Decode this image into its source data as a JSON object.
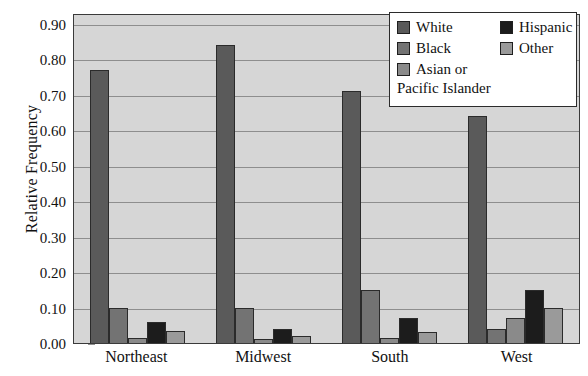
{
  "chart_data": {
    "type": "bar",
    "title": "",
    "xlabel": "",
    "ylabel": "Relative Frequency",
    "ylim": [
      0.0,
      0.93
    ],
    "grid": true,
    "legend_position": "top-right",
    "categories": [
      "Northeast",
      "Midwest",
      "South",
      "West"
    ],
    "y_ticks": [
      "0.00",
      "0.10",
      "0.20",
      "0.30",
      "0.40",
      "0.50",
      "0.60",
      "0.70",
      "0.80",
      "0.90"
    ],
    "y_tick_values": [
      0.0,
      0.1,
      0.2,
      0.3,
      0.4,
      0.5,
      0.6,
      0.7,
      0.8,
      0.9
    ],
    "series": [
      {
        "name": "White",
        "color": "#5a5a5a",
        "values": [
          0.77,
          0.84,
          0.71,
          0.64
        ]
      },
      {
        "name": "Black",
        "color": "#737373",
        "values": [
          0.1,
          0.1,
          0.15,
          0.04
        ]
      },
      {
        "name": "Asian or Pacific Islander",
        "color": "#8a8a8a",
        "values": [
          0.015,
          0.01,
          0.015,
          0.07
        ]
      },
      {
        "name": "Hispanic",
        "color": "#1c1c1c",
        "values": [
          0.06,
          0.04,
          0.07,
          0.15
        ]
      },
      {
        "name": "Other",
        "color": "#9a9a9a",
        "values": [
          0.035,
          0.02,
          0.03,
          0.1
        ]
      }
    ]
  },
  "legend": {
    "left_column": [
      {
        "label": "White",
        "color": "#5a5a5a"
      },
      {
        "label": "Black",
        "color": "#737373"
      },
      {
        "label": "Asian or",
        "label2": "Pacific Islander",
        "color": "#8a8a8a"
      }
    ],
    "right_column": [
      {
        "label": "Hispanic",
        "color": "#1c1c1c"
      },
      {
        "label": "Other",
        "color": "#9a9a9a"
      }
    ]
  },
  "colors": {
    "plot_background": "#d6d6d6",
    "gridline": "#8e8e8e",
    "axis": "#3a3a3a",
    "page_background": "#ffffff",
    "text": "#111111"
  }
}
